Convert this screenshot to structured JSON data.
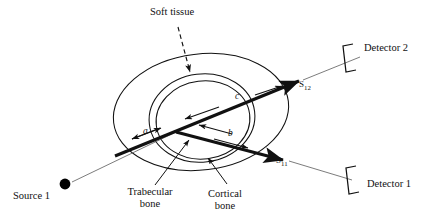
{
  "figure": {
    "type": "schematic-diagram",
    "background_color": "#ffffff",
    "line_color": "#111111"
  },
  "anatomy": {
    "layers": [
      {
        "id": "soft-tissue",
        "label": "Soft tissue",
        "shape": "ellipse",
        "order": "outer"
      },
      {
        "id": "cortical-bone",
        "label": "Cortical\nbone",
        "shape": "ellipse",
        "order": "middle"
      },
      {
        "id": "trabecular-bone",
        "label": "Trabecular\nbone",
        "shape": "ellipse",
        "order": "inner"
      }
    ]
  },
  "labels": {
    "soft_tissue": "Soft tissue",
    "trabecular_bone_line1": "Trabecular",
    "trabecular_bone_line2": "bone",
    "cortical_bone_line1": "Cortical",
    "cortical_bone_line2": "bone",
    "source_1": "Source 1",
    "detector_1": "Detector 1",
    "detector_2": "Detector 2"
  },
  "segments": [
    {
      "name": "a",
      "label": "a"
    },
    {
      "name": "b",
      "label": "b"
    },
    {
      "name": "c",
      "label": "c"
    }
  ],
  "beams": [
    {
      "id": "beam-1",
      "symbol": "S",
      "subscript": "11",
      "from": "Source 1",
      "to": "Detector 1"
    },
    {
      "id": "beam-2",
      "symbol": "S",
      "subscript": "12",
      "from": "Source 1",
      "to": "Detector 2"
    }
  ],
  "source_marker": {
    "name": "source-dot",
    "filled": true
  },
  "detectors": [
    {
      "id": "detector-1",
      "label": "Detector 1",
      "bracket": "left-bracket"
    },
    {
      "id": "detector-2",
      "label": "Detector 2",
      "bracket": "left-bracket"
    }
  ],
  "annotations": {
    "soft_tissue_pointer": "dashed-arrow",
    "trabecular_pointer": "solid-leader-line",
    "cortical_pointer": "solid-leader-line"
  }
}
